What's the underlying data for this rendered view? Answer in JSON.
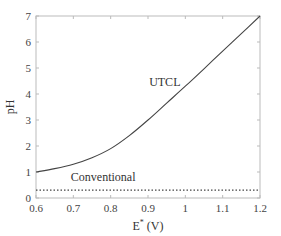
{
  "chart_data": {
    "type": "line",
    "title": "",
    "xlabel": "E* (V)",
    "xlabel_main": "E",
    "xlabel_sup": "*",
    "xlabel_unit": " (V)",
    "ylabel": "pH",
    "xlim": [
      0.6,
      1.2
    ],
    "ylim": [
      0,
      7
    ],
    "xticks": [
      0.6,
      0.7,
      0.8,
      0.9,
      1,
      1.1,
      1.2
    ],
    "xtick_labels": [
      "0.6",
      "0.7",
      "0.8",
      "0.9",
      "1",
      "1.1",
      "1.2"
    ],
    "yticks": [
      0,
      1,
      2,
      3,
      4,
      5,
      6,
      7
    ],
    "ytick_labels": [
      "0",
      "1",
      "2",
      "3",
      "4",
      "5",
      "6",
      "7"
    ],
    "grid": false,
    "legend": null,
    "series": [
      {
        "name": "UTCL",
        "style": "solid",
        "x": [
          0.6,
          0.65,
          0.7,
          0.75,
          0.8,
          0.85,
          0.9,
          0.95,
          1.0,
          1.05,
          1.1,
          1.15,
          1.2
        ],
        "values": [
          1.0,
          1.13,
          1.3,
          1.55,
          1.9,
          2.4,
          3.0,
          3.65,
          4.3,
          4.97,
          5.65,
          6.32,
          7.0
        ]
      },
      {
        "name": "Conventional",
        "style": "dotted",
        "x": [
          0.6,
          1.2
        ],
        "values": [
          0.3,
          0.3
        ]
      }
    ],
    "annotations": [
      {
        "text": "UTCL",
        "x": 0.945,
        "y": 4.3
      },
      {
        "text": "Conventional",
        "x": 0.78,
        "y": 0.65
      }
    ]
  }
}
